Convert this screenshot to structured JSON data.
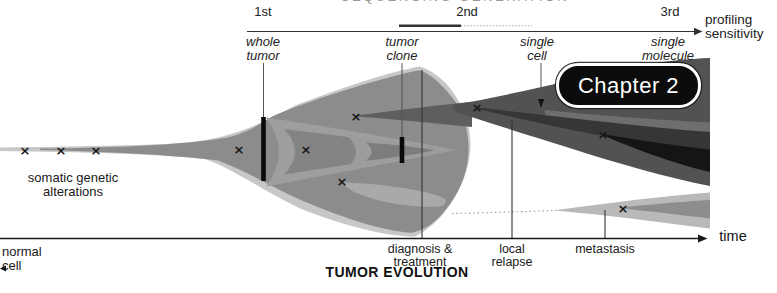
{
  "colors": {
    "stream_light": "#c7c7c7",
    "tumor_base": "#8c8c8c",
    "chevron_light": "#9e9e9e",
    "chevron_mid": "#848484",
    "chevron_tip_light": "#9c9c9c",
    "chevron_tip_dark": "#7d7d7d",
    "leaf_light": "#a9a9a9",
    "wedge_dark": "#5e5e5e",
    "stream_dark": "#525252",
    "band_sliver": "#6e6e6e",
    "band_darker": "#363636",
    "band_black": "#151515",
    "fan_light": "#b9b9b9",
    "fan_mid": "#8d8d8d",
    "badge_bg": "#0c0c0c",
    "badge_border": "#ffffff",
    "line_dark": "#333333",
    "dotted_gray": "#9a9a9a"
  },
  "top_axis": {
    "cropped_title": "SEQUENCING GENERATION",
    "generations": [
      {
        "label": "1st"
      },
      {
        "label": "2nd"
      },
      {
        "label": "3rd"
      }
    ],
    "profiling_label": "profiling\nsensitivity",
    "methods": [
      {
        "label": "whole\ntumor"
      },
      {
        "label": "tumor\nclone"
      },
      {
        "label": "single\ncell"
      },
      {
        "label": "single\nmolecule"
      }
    ]
  },
  "figure": {
    "somatic_label": "somatic genetic\nalterations",
    "normal_cell_label": "normal\ncell",
    "chapter_badge": "Chapter 2",
    "mutation_symbol": "×",
    "mutations": [
      [
        25,
        150
      ],
      [
        61,
        150
      ],
      [
        96,
        150
      ],
      [
        239,
        149
      ],
      [
        306,
        149
      ],
      [
        356,
        116
      ],
      [
        342,
        181
      ],
      [
        477,
        107
      ],
      [
        603,
        134
      ],
      [
        623,
        208
      ]
    ]
  },
  "time_axis": {
    "label": "time",
    "events": [
      {
        "label": "diagnosis &\ntreatment"
      },
      {
        "label": "local\nrelapse"
      },
      {
        "label": "metastasis"
      }
    ],
    "title": "TUMOR EVOLUTION"
  }
}
